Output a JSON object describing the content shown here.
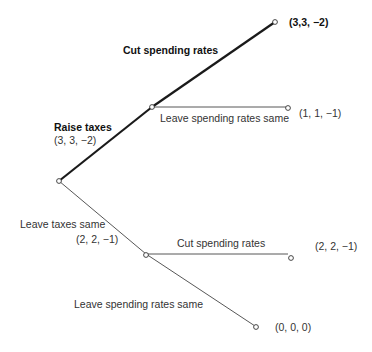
{
  "diagram": {
    "type": "game-tree",
    "root": {
      "id": "root",
      "branches": [
        {
          "label": "Raise taxes",
          "payoff": "(3, 3, −2)",
          "emphasized": true,
          "node": {
            "branches": [
              {
                "label": "Cut spending rates",
                "payoff": "(3,3, −2)",
                "emphasized": true
              },
              {
                "label": "Leave spending rates same",
                "payoff": "(1, 1, −1)",
                "emphasized": false
              }
            ]
          }
        },
        {
          "label": "Leave taxes same",
          "payoff": "(2, 2, −1)",
          "emphasized": false,
          "node": {
            "branches": [
              {
                "label": "Cut spending rates",
                "payoff": "(2, 2, −1)",
                "emphasized": false
              },
              {
                "label": "Leave spending rates same",
                "payoff": "(0, 0, 0)",
                "emphasized": false
              }
            ]
          }
        }
      ]
    },
    "labels": {
      "raise_taxes": "Raise taxes",
      "raise_taxes_payoff": "(3, 3, −2)",
      "cut_spending_top": "Cut spending rates",
      "top_payoff": "(3,3, −2)",
      "leave_spending_top": "Leave spending rates same",
      "mid_payoff": "(1, 1, −1)",
      "leave_taxes": "Leave taxes same",
      "leave_taxes_payoff": "(2, 2, −1)",
      "cut_spending_bottom": "Cut spending rates",
      "cut_bottom_payoff": "(2, 2, −1)",
      "leave_spending_bottom": "Leave spending rates same",
      "bottom_payoff": "(0, 0, 0)"
    },
    "colors": {
      "line": "#222222",
      "node_fill": "#ffffff"
    }
  }
}
